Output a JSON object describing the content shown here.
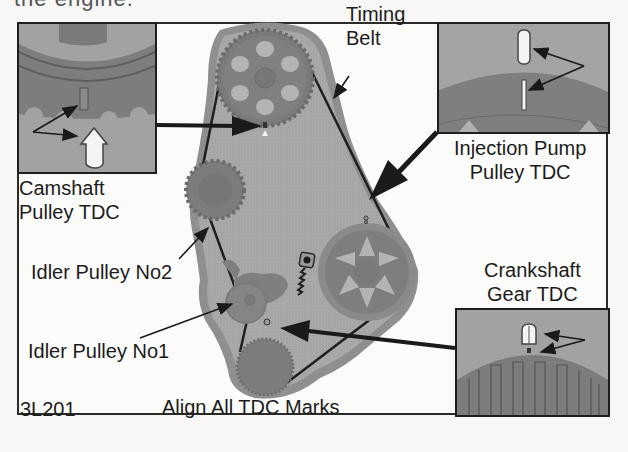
{
  "page": {
    "top_cut_text": "the engine."
  },
  "diagram": {
    "figure_id": "3L201",
    "caption": "Align All TDC Marks",
    "labels": {
      "timing_belt": [
        "Timing",
        "Belt"
      ],
      "injection_pump": [
        "Injection Pump",
        "Pulley TDC"
      ],
      "camshaft": [
        "Camshaft",
        "Pulley TDC"
      ],
      "idler_no2": "Idler Pulley No2",
      "idler_no1": "Idler Pulley No1",
      "crankshaft": [
        "Crankshaft",
        "Gear TDC"
      ]
    },
    "insets": [
      {
        "name": "camshaft-pulley-tdc-inset",
        "description": "Camshaft pulley TDC mark detail"
      },
      {
        "name": "injection-pump-pulley-tdc-inset",
        "description": "Injection pump pulley TDC mark detail"
      },
      {
        "name": "crankshaft-gear-tdc-inset",
        "description": "Crankshaft gear TDC mark detail"
      }
    ],
    "components": [
      "camshaft-pulley",
      "idler-pulley-no2",
      "injection-pump-pulley",
      "idler-pulley-no1",
      "tensioner-spring",
      "crankshaft-gear",
      "timing-belt",
      "timing-cover-plate"
    ],
    "colors": {
      "plate": "#a9a9a9",
      "plate_edge": "#8e8e8e",
      "gear": "#7d7d7d",
      "gear_window": "#b4b4b4",
      "belt": "#1f1f1f",
      "inset_bg": "#9c9c9c",
      "line": "#1c1c1c"
    }
  }
}
